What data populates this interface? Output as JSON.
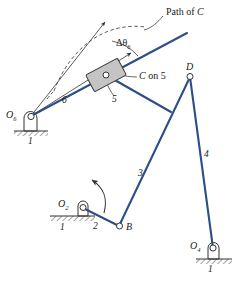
{
  "figure": {
    "type": "kinematic-linkage-diagram",
    "background_color": "#ffffff",
    "link_color": "#2d4f87",
    "line_color": "#333333",
    "slider_fill": "#c4c4c4"
  },
  "annotations": {
    "path_of_c": "Path of",
    "path_of_c_italic": "C",
    "delta_theta": "Δθ",
    "delta_theta_sub": "6",
    "c_on_5_c": "C",
    "c_on_5_rest": "on 5"
  },
  "joints": [
    {
      "id": "O6",
      "letter": "O",
      "sub": "6",
      "x": 30,
      "y": 117
    },
    {
      "id": "B",
      "letter": "B",
      "sub": "",
      "x": 119,
      "y": 226
    },
    {
      "id": "O2",
      "letter": "O",
      "sub": "2",
      "x": 72,
      "y": 204
    },
    {
      "id": "D",
      "letter": "D",
      "sub": "",
      "x": 190,
      "y": 76
    },
    {
      "id": "O4",
      "letter": "O",
      "sub": "4",
      "x": 211,
      "y": 246
    }
  ],
  "link_labels": [
    {
      "name": "link-6",
      "text": "6",
      "x": 62,
      "y": 101
    },
    {
      "name": "link-5",
      "text": "5",
      "x": 114,
      "y": 100
    },
    {
      "name": "link-3",
      "text": "3",
      "x": 140,
      "y": 174
    },
    {
      "name": "link-4",
      "text": "4",
      "x": 206,
      "y": 155
    },
    {
      "name": "link-2",
      "text": "2",
      "x": 94,
      "y": 228
    }
  ],
  "ground_labels": [
    {
      "name": "ground-o6",
      "text": "1",
      "x": 28,
      "y": 141
    },
    {
      "name": "ground-o2",
      "text": "1",
      "x": 61,
      "y": 230
    },
    {
      "name": "ground-o4",
      "text": "1",
      "x": 206,
      "y": 269
    }
  ]
}
